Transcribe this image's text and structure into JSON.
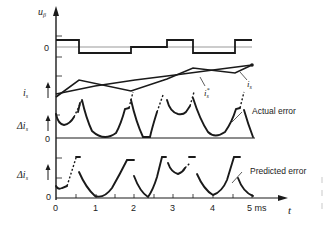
{
  "axes": {
    "top_ylabel": "u",
    "top_ylabel_sub": "β",
    "top_zero": "0",
    "current_ylabel": "i",
    "current_ylabel_sub": "s",
    "actual_ylabel": "Δi",
    "actual_ylabel_sub": "s",
    "actual_zero": "0",
    "pred_ylabel": "Δi",
    "pred_ylabel_sub": "s",
    "pred_zero": "0",
    "x_label": "t",
    "x_ticks": [
      "0",
      "1",
      "2",
      "3",
      "4",
      "5 ms"
    ]
  },
  "annotations": {
    "is_ref": "i",
    "is_ref_sup": "*",
    "is_ref_sub": "s",
    "is_actual": "i",
    "is_actual_sub": "s",
    "actual_error": "Actual error",
    "predicted_error": "Predicted error"
  },
  "colors": {
    "ink": "#1a1a1a",
    "thin": "#555555",
    "background": "#ffffff"
  }
}
